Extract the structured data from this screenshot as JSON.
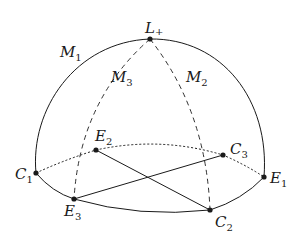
{
  "diagram": {
    "type": "spherical-dome",
    "stroke_color": "#1a1a1a",
    "points": {
      "L_plus": {
        "name": "L",
        "sub": "+",
        "x": 150,
        "y": 39
      },
      "C1": {
        "name": "C",
        "sub": "1",
        "x": 36,
        "y": 173
      },
      "C2": {
        "name": "C",
        "sub": "2",
        "x": 210,
        "y": 210
      },
      "C3": {
        "name": "C",
        "sub": "3",
        "x": 223,
        "y": 155
      },
      "E1": {
        "name": "E",
        "sub": "1",
        "x": 264,
        "y": 177
      },
      "E2": {
        "name": "E",
        "sub": "2",
        "x": 96,
        "y": 150
      },
      "E3": {
        "name": "E",
        "sub": "3",
        "x": 74,
        "y": 199
      }
    },
    "meridians": {
      "M1": {
        "name": "M",
        "sub": "1",
        "style": "solid"
      },
      "M2": {
        "name": "M",
        "sub": "2",
        "style": "dashed"
      },
      "M3": {
        "name": "M",
        "sub": "3",
        "style": "dashed"
      }
    },
    "edges": [
      {
        "from": "C1",
        "to": "E1",
        "via": "L_plus",
        "style": "solid",
        "label": "outer meridian arc"
      },
      {
        "from": "C1",
        "to": "E3",
        "style": "solid",
        "label": "front equator arc"
      },
      {
        "from": "E3",
        "to": "C2",
        "style": "solid",
        "label": "front equator arc"
      },
      {
        "from": "C2",
        "to": "E1",
        "style": "solid",
        "label": "front equator arc"
      },
      {
        "from": "C1",
        "to": "E2",
        "style": "dotted",
        "label": "back equator arc"
      },
      {
        "from": "E2",
        "to": "C3",
        "style": "dotted",
        "label": "back equator arc"
      },
      {
        "from": "C3",
        "to": "E1",
        "style": "dotted",
        "label": "back equator arc"
      },
      {
        "from": "L_plus",
        "to": "E3",
        "style": "dashed",
        "label": "meridian M3"
      },
      {
        "from": "L_plus",
        "to": "C2",
        "style": "dashed",
        "label": "meridian M2"
      },
      {
        "from": "E2",
        "to": "C2",
        "style": "solid",
        "label": "chord"
      },
      {
        "from": "E3",
        "to": "C3",
        "style": "solid",
        "label": "chord"
      }
    ]
  }
}
